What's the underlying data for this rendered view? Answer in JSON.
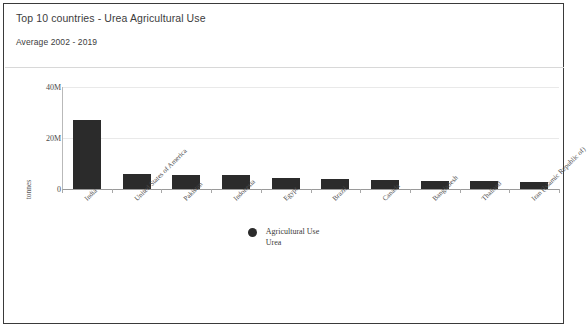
{
  "header": {
    "title": "Top 10 countries - Urea Agricultural Use",
    "subtitle": "Average 2002 - 2019"
  },
  "legend": {
    "line1": "Agricultural Use",
    "line2": "Urea",
    "marker_color": "#2b2b2b"
  },
  "colors": {
    "bar": "#2b2b2b",
    "grid": "#e9e9e9",
    "axis": "#9a9a9a",
    "text": "#3c3c3c"
  },
  "chart_data": {
    "type": "bar",
    "title": "Top 10 countries - Urea Agricultural Use",
    "subtitle": "Average 2002 - 2019",
    "xlabel": "",
    "ylabel": "tonnes",
    "ylim": [
      0,
      40000000
    ],
    "yticks": [
      0,
      20000000,
      40000000
    ],
    "ytick_labels": [
      "0",
      "20M",
      "40M"
    ],
    "grid": true,
    "legend_position": "bottom-center",
    "series_name": "Agricultural Use Urea",
    "categories": [
      "India",
      "United States of America",
      "Pakistan",
      "Indonesia",
      "Egypt",
      "Brazil",
      "Canada",
      "Bangladesh",
      "Thailand",
      "Iran (Islamic Republic of)"
    ],
    "values": [
      27000000,
      6000000,
      5600000,
      5400000,
      4300000,
      3800000,
      3400000,
      3200000,
      3000000,
      2600000
    ]
  }
}
